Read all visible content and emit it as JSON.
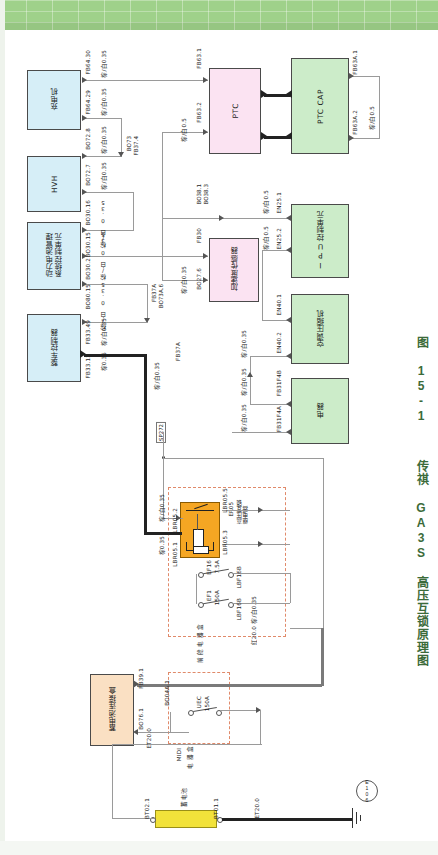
{
  "page": {
    "caption_number": "图 15-1",
    "caption_title": "传祺 GA3S 高压互锁原理图",
    "accent_green": "#9fd18a",
    "caption_color": "#3c6b3a"
  },
  "diagram": {
    "title": "传祺 GA3S 高压互锁原理图",
    "blocks": [
      {
        "id": "charger",
        "label": "充电机",
        "color": "#d6eef7",
        "type": "blue"
      },
      {
        "id": "hvh",
        "label": "HVH",
        "color": "#d6eef7",
        "type": "blue"
      },
      {
        "id": "bms",
        "label": "动力电池管理\n系统控制单元",
        "color": "#d6eef7",
        "type": "blue"
      },
      {
        "id": "vcu",
        "label": "整车控制器",
        "color": "#d6eef7",
        "type": "blue"
      },
      {
        "id": "ptc",
        "label": "PTC",
        "color": "#fbe3f2",
        "type": "pink"
      },
      {
        "id": "accsensor",
        "label": "加速度传感器",
        "color": "#fbe3f2",
        "type": "pink"
      },
      {
        "id": "ptccap",
        "label": "PTC CAP",
        "color": "#ccecc9",
        "type": "green"
      },
      {
        "id": "ipu",
        "label": "IPU控制单元",
        "color": "#ccecc9",
        "type": "green"
      },
      {
        "id": "compressor",
        "label": "空调压缩机",
        "color": "#ccecc9",
        "type": "green"
      },
      {
        "id": "relaybox",
        "label": "电器",
        "color": "#ccecc9",
        "type": "green"
      },
      {
        "id": "hvrelay",
        "label": "",
        "color": "#f5a623",
        "type": "orange"
      },
      {
        "id": "battbox",
        "label": "蓄电池连接盒",
        "color": "#fae0c3",
        "type": "peach"
      },
      {
        "id": "battery",
        "label": "蓄电池",
        "color": "#f2e23a",
        "type": "yellow"
      }
    ],
    "relay": {
      "designator": "ER05",
      "name": "高压互锁\n继电器"
    },
    "fuses": [
      {
        "designator": "EF16",
        "rating": "7.5A"
      },
      {
        "designator": "EF1",
        "rating": "150A"
      },
      {
        "designator": "UEC",
        "rating": "150A"
      }
    ],
    "enclosures": [
      {
        "id": "front-fuse-box",
        "label": "前 舱 电 器 盒"
      },
      {
        "id": "midi-fuse-box",
        "label": "电 器 盒",
        "tag": "MIDI"
      }
    ],
    "ground": {
      "label": "E106"
    },
    "splice": {
      "label": "SP272"
    },
    "wire_specs": [
      "棕/白0.35",
      "棕/白0.5",
      "棕0.35",
      "棕/白 0.35",
      "棕/白0.5",
      "棕/白0.35"
    ],
    "connectors": [
      "FB64.30",
      "FB64.29",
      "FB63.1",
      "FB63.2",
      "FB63A.1",
      "FB63A.2",
      "BO72.8",
      "BO72.7",
      "BO30.16",
      "BO30.15",
      "BO30.2",
      "BO80.15",
      "FB33.49",
      "FB33.12",
      "FB37A",
      "BO73A.6",
      "BO73",
      "FB37.4",
      "BO38.1",
      "BO38.3",
      "FB30",
      "BO27.6",
      "EN25.1",
      "EN25.2",
      "EN40.1",
      "EN40.2",
      "FB31F4B",
      "FB31F4A",
      "LBR05.5",
      "LBR05.2",
      "LBR05.3",
      "LBR05.1",
      "LBF16B",
      "LBF16B",
      "FB39.1",
      "BO76.1",
      "ET20.0",
      "BO04A.1",
      "BT02.1",
      "BT01.1",
      "ET20.0"
    ]
  }
}
